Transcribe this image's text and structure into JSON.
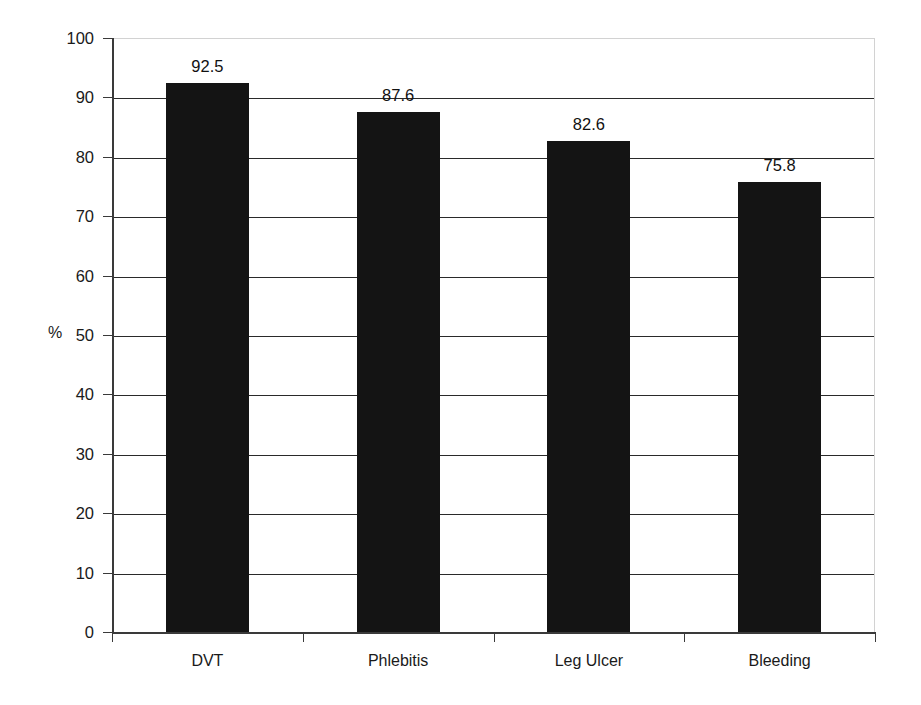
{
  "chart_data": {
    "type": "bar",
    "title": "",
    "xlabel": "",
    "ylabel": "%",
    "categories": [
      "DVT",
      "Phlebitis",
      "Leg Ulcer",
      "Bleeding"
    ],
    "values": [
      92.5,
      87.6,
      82.6,
      75.8
    ],
    "value_labels": [
      "92.5",
      "87.6",
      "82.6",
      "75.8"
    ],
    "ylim": [
      0,
      100
    ],
    "ytick_step": 10,
    "ytick_labels": [
      "100",
      "90",
      "80",
      "70",
      "60",
      "50",
      "40",
      "30",
      "20",
      "10",
      "0"
    ],
    "ytick_values": [
      100,
      90,
      80,
      70,
      60,
      50,
      40,
      30,
      20,
      10,
      0
    ],
    "grid": true,
    "grid_axis": "y",
    "legend": false,
    "legend_position": "none",
    "bar_color": "#141414",
    "grid_color": "#2a2a2a",
    "axis_color": "#3a3a3a",
    "plot_border_color": "#d2d2d2",
    "background_color": "#ffffff"
  }
}
